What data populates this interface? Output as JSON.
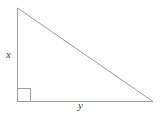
{
  "figure": {
    "name": "right-triangle-diagram",
    "background_color": "#ffffff",
    "stroke_color": "#9a9a9a",
    "stroke_width": 1,
    "label_color": "#3c3c3c",
    "labels": {
      "vertical_leg": "x",
      "horizontal_leg": "y"
    },
    "geometry": {
      "apex": [
        17,
        8
      ],
      "right_angle_vertex": [
        17,
        101
      ],
      "right_vertex": [
        153,
        101
      ],
      "right_angle_marker": {
        "x": 17,
        "y": 88,
        "size": 13
      }
    },
    "shape_type": "right triangle"
  }
}
